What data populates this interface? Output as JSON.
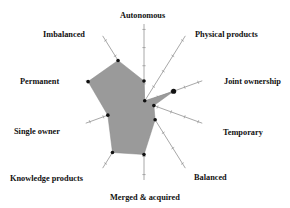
{
  "chart_data": {
    "type": "radar",
    "title": "",
    "axes": [
      "Autonomous",
      "Physical products",
      "Joint ownership",
      "Temporary",
      "Balanced",
      "Merged & acquired",
      "Knowledge products",
      "Single owner",
      "Permanent",
      "Imbalanced"
    ],
    "series": [
      {
        "name": "profile",
        "values": [
          0.3,
          0.02,
          0.45,
          0.15,
          0.3,
          0.75,
          0.85,
          0.55,
          0.85,
          0.7
        ]
      }
    ],
    "range": [
      0,
      1
    ],
    "grid": false,
    "legend": "none",
    "fill_color": "#9a9a9a",
    "axis_color": "#a8a8a8",
    "marker_color": "#111111"
  },
  "labels": {
    "autonomous": "Autonomous",
    "physical_products": "Physical products",
    "joint_ownership": "Joint ownership",
    "temporary": "Temporary",
    "balanced": "Balanced",
    "merged_acquired": "Merged & acquired",
    "knowledge_products": "Knowledge products",
    "single_owner": "Single owner",
    "permanent": "Permanent",
    "imbalanced": "Imbalanced"
  }
}
